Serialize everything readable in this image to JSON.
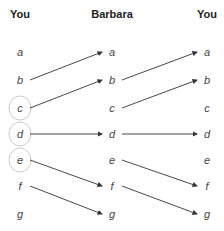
{
  "columns": [
    {
      "label": "You",
      "x": 20
    },
    {
      "label": "Barbara",
      "x": 112
    },
    {
      "label": "You",
      "x": 207
    }
  ],
  "letters": [
    "a",
    "b",
    "c",
    "d",
    "e",
    "f",
    "g"
  ],
  "row_y": [
    52,
    80,
    108,
    134,
    160,
    186,
    214
  ],
  "circled_left": [
    "c",
    "d",
    "e"
  ],
  "arrows_left": [
    {
      "from": "b",
      "to": "a"
    },
    {
      "from": "c",
      "to": "b"
    },
    {
      "from": "d",
      "to": "d"
    },
    {
      "from": "e",
      "to": "f"
    },
    {
      "from": "f",
      "to": "g"
    }
  ],
  "arrows_right": [
    {
      "from": "b",
      "to": "a"
    },
    {
      "from": "c",
      "to": "b"
    },
    {
      "from": "d",
      "to": "d"
    },
    {
      "from": "e",
      "to": "f"
    },
    {
      "from": "f",
      "to": "g"
    }
  ],
  "colors": {
    "arrow": "#333333",
    "circle": "#cccccc",
    "text": "#444444"
  }
}
